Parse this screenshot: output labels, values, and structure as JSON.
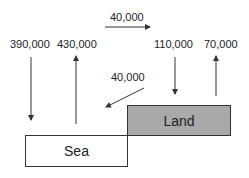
{
  "diagram": {
    "boxes": {
      "sea": {
        "label": "Sea",
        "fill": "#ffffff"
      },
      "land": {
        "label": "Land",
        "fill": "#a9a9a9"
      }
    },
    "flows": [
      {
        "id": "sea-down",
        "label": "390,000",
        "direction": "down",
        "target": "Sea"
      },
      {
        "id": "sea-up",
        "label": "430,000",
        "direction": "up",
        "source": "Sea"
      },
      {
        "id": "sea-to-land-top",
        "label": "40,000",
        "direction": "right"
      },
      {
        "id": "land-down",
        "label": "110,000",
        "direction": "down",
        "target": "Land"
      },
      {
        "id": "land-up",
        "label": "70,000",
        "direction": "up",
        "source": "Land"
      },
      {
        "id": "land-to-sea",
        "label": "40,000",
        "direction": "down-left",
        "source": "Land",
        "target": "Sea"
      }
    ],
    "colors": {
      "line": "#333333",
      "text": "#222222"
    }
  }
}
